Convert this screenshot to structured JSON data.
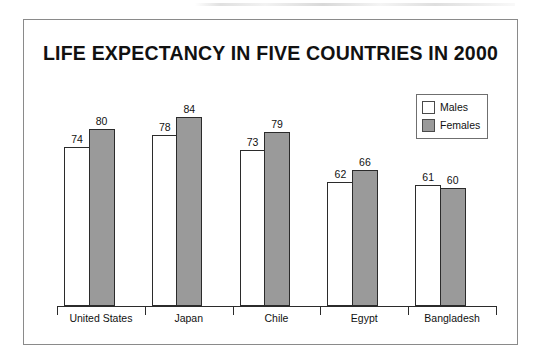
{
  "chart_data": {
    "type": "bar",
    "title": "LIFE EXPECTANCY IN FIVE COUNTRIES IN 2000",
    "xlabel": "",
    "ylabel": "",
    "grid": false,
    "legend_position": "top-right",
    "axis_baseline_value": 20,
    "ylim": [
      20,
      90
    ],
    "categories": [
      "United States",
      "Japan",
      "Chile",
      "Egypt",
      "Bangladesh"
    ],
    "series": [
      {
        "name": "Males",
        "color": "#ffffff",
        "values": [
          74,
          78,
          73,
          62,
          61
        ]
      },
      {
        "name": "Females",
        "color": "#9a9a9a",
        "values": [
          80,
          84,
          79,
          66,
          60
        ]
      }
    ]
  },
  "legend": {
    "items": [
      {
        "label": "Males"
      },
      {
        "label": "Females"
      }
    ]
  },
  "colors": {
    "males_fill": "#ffffff",
    "females_fill": "#9a9a9a",
    "bar_outline": "#2b2b2b",
    "frame": "#8a8a8a",
    "text": "#111111"
  }
}
